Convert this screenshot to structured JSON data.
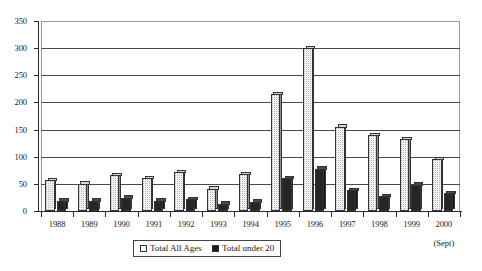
{
  "chart_data": {
    "type": "bar",
    "title": "",
    "subtitle": "",
    "xlabel": "",
    "ylabel": "",
    "ylim": [
      0,
      350
    ],
    "yticks": [
      0,
      50,
      100,
      150,
      200,
      250,
      300,
      350
    ],
    "grid": true,
    "legend_position": "bottom-center",
    "categories": [
      "1988",
      "1989",
      "1990",
      "1991",
      "1992",
      "1993",
      "1994",
      "1995",
      "1996",
      "1997",
      "1998",
      "1999",
      "2000"
    ],
    "category_sublabels": [
      "",
      "",
      "",
      "",
      "",
      "",
      "",
      "",
      "",
      "",
      "",
      "",
      "(Sept)"
    ],
    "series": [
      {
        "name": "Total All Ages",
        "values": [
          57,
          50,
          66,
          60,
          71,
          41,
          68,
          215,
          300,
          155,
          140,
          132,
          95
        ]
      },
      {
        "name": "Total under 20",
        "values": [
          19,
          19,
          24,
          19,
          22,
          13,
          17,
          60,
          78,
          38,
          27,
          48,
          33
        ]
      }
    ]
  },
  "legend": {
    "entries": [
      {
        "label": "Total All Ages",
        "swatch": "white-square"
      },
      {
        "label": "Total under 20",
        "swatch": "black-square"
      }
    ]
  },
  "colors": {
    "series_a_fill": "#f2f2f2",
    "series_b_fill": "#262626",
    "axis": "#2a2a2a",
    "gridline": "#4a4a4a",
    "frame": "#9a9a9a",
    "background": "#ffffff"
  }
}
